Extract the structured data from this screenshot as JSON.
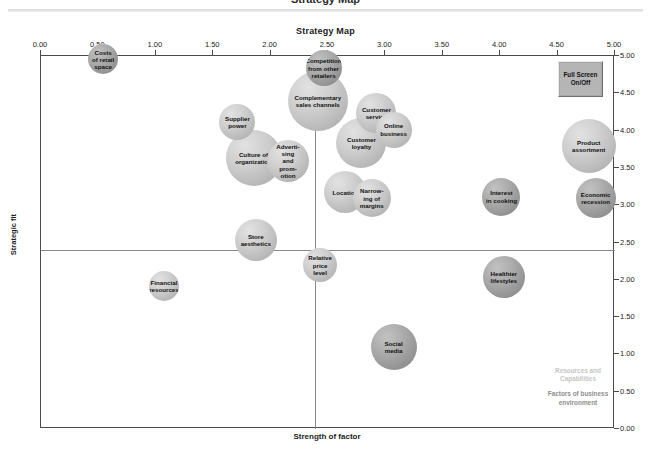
{
  "clipped_header": "Strategy Map",
  "chart_data": {
    "type": "scatter",
    "title": "Strategy Map",
    "xlabel": "Strength of factor",
    "ylabel": "Strategic fit",
    "xlim": [
      0,
      5
    ],
    "ylim": [
      0,
      5
    ],
    "xticks": [
      "0.00",
      "0.50",
      "1.00",
      "1.50",
      "2.00",
      "2.50",
      "3.00",
      "3.50",
      "4.00",
      "4.50",
      "5.00"
    ],
    "yticks": [
      "0.00",
      "0.50",
      "1.00",
      "1.50",
      "2.00",
      "2.50",
      "3.00",
      "3.50",
      "4.00",
      "4.50",
      "5.00"
    ],
    "grid": false,
    "quadrant_lines": {
      "x": 2.5,
      "y": 2.5
    },
    "legend_position": "bottom-right",
    "series": [
      {
        "name": "Resources and Capabilities",
        "color": "#cfcfcf",
        "points": [
          {
            "label": "Supplier\npower",
            "x": 1.72,
            "y": 4.1,
            "size": 36
          },
          {
            "label": "Culture of\norganization",
            "x": 1.86,
            "y": 3.62,
            "size": 56
          },
          {
            "label": "Adverti-\nsing\nand\nprom-\notion",
            "x": 2.16,
            "y": 3.58,
            "size": 42
          },
          {
            "label": "Complementary\nsales channels",
            "x": 2.42,
            "y": 4.38,
            "size": 60
          },
          {
            "label": "Customer\nservice",
            "x": 2.93,
            "y": 4.22,
            "size": 40
          },
          {
            "label": "Customer\nloyalty",
            "x": 2.8,
            "y": 3.82,
            "size": 50
          },
          {
            "label": "Online\nbusiness",
            "x": 3.08,
            "y": 4.0,
            "size": 36
          },
          {
            "label": "Location",
            "x": 2.66,
            "y": 3.16,
            "size": 42
          },
          {
            "label": "Narrow-\ning of\nmargins",
            "x": 2.89,
            "y": 3.08,
            "size": 38
          },
          {
            "label": "Product\nassortment",
            "x": 4.78,
            "y": 3.78,
            "size": 54
          },
          {
            "label": "Store\naesthetics",
            "x": 1.88,
            "y": 2.52,
            "size": 42
          },
          {
            "label": "Relative\nprice\nlevel",
            "x": 2.44,
            "y": 2.18,
            "size": 34
          },
          {
            "label": "Financial\nresources",
            "x": 1.08,
            "y": 1.9,
            "size": 30
          }
        ]
      },
      {
        "name": "Factors of business environment",
        "color": "#949494",
        "points": [
          {
            "label": "Costs\nof retail\nspace",
            "x": 0.55,
            "y": 4.94,
            "size": 30
          },
          {
            "label": "Competition\nfrom other\nretailers",
            "x": 2.47,
            "y": 4.82,
            "size": 36
          },
          {
            "label": "Interest\nin cooking",
            "x": 4.02,
            "y": 3.1,
            "size": 38
          },
          {
            "label": "Economic\nrecession",
            "x": 4.84,
            "y": 3.08,
            "size": 40
          },
          {
            "label": "Healthier\nlifestyles",
            "x": 4.04,
            "y": 2.02,
            "size": 42
          },
          {
            "label": "Social\nmedia",
            "x": 3.08,
            "y": 1.08,
            "size": 46
          }
        ]
      }
    ]
  },
  "controls": {
    "fullscreen_label": "Full\nScreen\nOn/Off"
  },
  "legend": {
    "resources_label": "Resources and\nCapabilities",
    "factors_label": "Factors of business\nenvironment"
  }
}
